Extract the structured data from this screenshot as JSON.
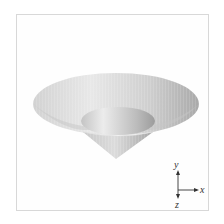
{
  "figure": {
    "colors": {
      "surface_light": "#e6e6e6",
      "surface_mid": "#bdbdbd",
      "surface_dark": "#9a9a9a",
      "frame": "#d8d8d8",
      "axis": "#333333"
    }
  },
  "axis_indicator": {
    "labels": {
      "x": "x",
      "y": "y",
      "z": "z"
    }
  }
}
